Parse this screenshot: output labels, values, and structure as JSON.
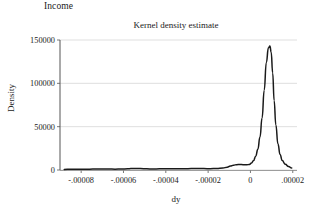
{
  "panel": {
    "label": "Income"
  },
  "chart_data": {
    "type": "line",
    "title": "Kernel density estimate",
    "xlabel": "dy",
    "ylabel": "Density",
    "xlim": [
      -9e-05,
      2.2e-05
    ],
    "ylim": [
      0,
      150000
    ],
    "grid": "horizontal",
    "legend": "none",
    "xticks": [
      -8e-05,
      -6e-05,
      -4e-05,
      -2e-05,
      0,
      2e-05
    ],
    "xtick_labels": [
      "-.00008",
      "-.00006",
      "-.00004",
      "-.00002",
      "0",
      ".00002"
    ],
    "yticks": [
      0,
      50000,
      100000,
      150000
    ],
    "ytick_labels": [
      "0",
      "50000",
      "100000",
      "150000"
    ],
    "series": [
      {
        "name": "Kernel density estimate",
        "color": "#1a1a1a",
        "x": [
          -8.8e-05,
          -8.5e-05,
          -8.2e-05,
          -7.9e-05,
          -7.6e-05,
          -7.3e-05,
          -7e-05,
          -6.7e-05,
          -6.4e-05,
          -6.1e-05,
          -5.8e-05,
          -5.5e-05,
          -5.2e-05,
          -4.9e-05,
          -4.6e-05,
          -4.3e-05,
          -4e-05,
          -3.7e-05,
          -3.4e-05,
          -3.1e-05,
          -2.8e-05,
          -2.5e-05,
          -2.2e-05,
          -1.9e-05,
          -1.6e-05,
          -1.3e-05,
          -1.1e-05,
          -9.5e-06,
          -8e-06,
          -6.5e-06,
          -5e-06,
          -3.5e-06,
          -2e-06,
          -5e-07,
          5e-07,
          1.5e-06,
          2.5e-06,
          3.5e-06,
          4.5e-06,
          5.5e-06,
          6.5e-06,
          7.5e-06,
          8.5e-06,
          9.2e-06,
          9.8e-06,
          1.05e-05,
          1.12e-05,
          1.2e-05,
          1.3e-05,
          1.4e-05,
          1.5e-05,
          1.65e-05,
          1.8e-05,
          1.95e-05
        ],
        "y": [
          700,
          800,
          900,
          1000,
          1000,
          1100,
          1200,
          1100,
          1000,
          1100,
          1400,
          1800,
          1600,
          1300,
          1200,
          1300,
          1500,
          1400,
          1300,
          1400,
          1600,
          1700,
          1600,
          1500,
          1700,
          2200,
          3200,
          4600,
          5600,
          6200,
          6400,
          6200,
          6000,
          6400,
          8000,
          11000,
          16000,
          24000,
          38000,
          60000,
          92000,
          124000,
          141000,
          143000,
          136000,
          112000,
          80000,
          52000,
          30000,
          18000,
          11000,
          6500,
          4000,
          2200
        ]
      }
    ]
  }
}
